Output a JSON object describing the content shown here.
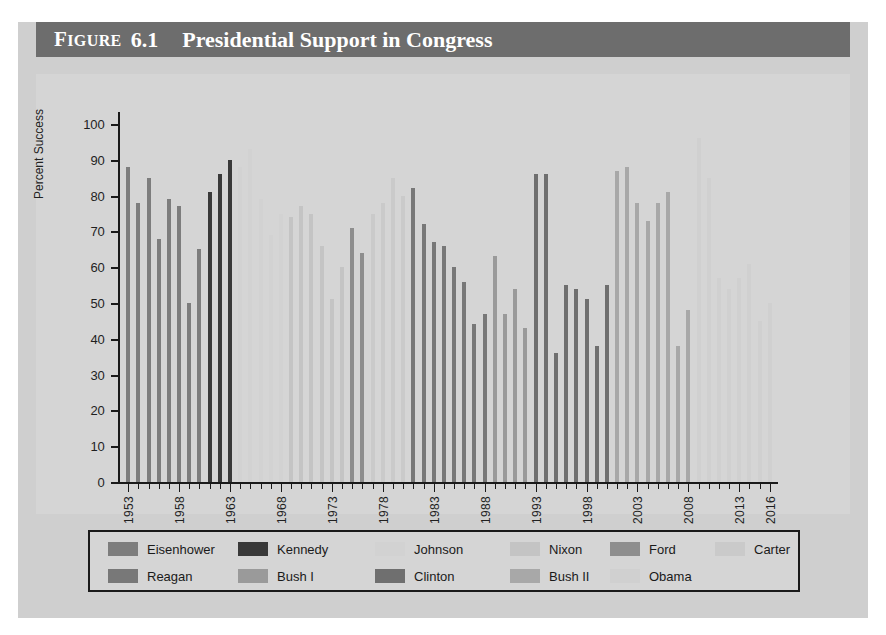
{
  "figure": {
    "label_word": "Figure",
    "number": "6.1",
    "title": "Presidential Support in Congress"
  },
  "colors": {
    "page_background": "#ffffff",
    "figure_background": "#cfcfcf",
    "plot_background": "#d5d5d5",
    "titlebar_background": "#6d6d6d",
    "titlebar_text": "#ffffff",
    "axis": "#1a1a1a"
  },
  "legend": {
    "position": "bottom",
    "rows": [
      [
        {
          "name": "Eisenhower",
          "color": "#7d7d7d"
        },
        {
          "name": "Kennedy",
          "color": "#393939"
        },
        {
          "name": "Johnson",
          "color": "#d2d2d2"
        },
        {
          "name": "Nixon",
          "color": "#c4c4c4"
        },
        {
          "name": "Ford",
          "color": "#8e8e8e"
        },
        {
          "name": "Carter",
          "color": "#cacaca"
        }
      ],
      [
        {
          "name": "Reagan",
          "color": "#787878"
        },
        {
          "name": "Bush I",
          "color": "#9a9a9a"
        },
        {
          "name": "Clinton",
          "color": "#6f6f6f"
        },
        {
          "name": "Bush II",
          "color": "#a8a8a8"
        },
        {
          "name": "Obama",
          "color": "#d0d0d0"
        }
      ]
    ]
  },
  "chart_data": {
    "type": "bar",
    "title": "Presidential Support in Congress",
    "xlabel": "",
    "ylabel": "Percent Success",
    "ylim": [
      0,
      100
    ],
    "ytick_step": 10,
    "yticks": [
      0,
      10,
      20,
      30,
      40,
      50,
      60,
      70,
      80,
      90,
      100
    ],
    "xlim": [
      1953,
      2016
    ],
    "xticks": [
      1953,
      1958,
      1963,
      1968,
      1973,
      1978,
      1983,
      1988,
      1993,
      1998,
      2003,
      2008,
      2013,
      2016
    ],
    "grid": false,
    "legend_position": "bottom",
    "series": [
      {
        "name": "Eisenhower",
        "color": "#7d7d7d",
        "points": [
          {
            "x": 1953,
            "y": 88
          },
          {
            "x": 1954,
            "y": 78
          },
          {
            "x": 1955,
            "y": 85
          },
          {
            "x": 1956,
            "y": 68
          },
          {
            "x": 1957,
            "y": 79
          },
          {
            "x": 1958,
            "y": 77
          },
          {
            "x": 1959,
            "y": 50
          },
          {
            "x": 1960,
            "y": 65
          }
        ]
      },
      {
        "name": "Kennedy",
        "color": "#393939",
        "points": [
          {
            "x": 1961,
            "y": 81
          },
          {
            "x": 1962,
            "y": 86
          },
          {
            "x": 1963,
            "y": 90
          }
        ]
      },
      {
        "name": "Johnson",
        "color": "#d2d2d2",
        "points": [
          {
            "x": 1964,
            "y": 88
          },
          {
            "x": 1965,
            "y": 93
          },
          {
            "x": 1966,
            "y": 79
          },
          {
            "x": 1967,
            "y": 69
          },
          {
            "x": 1968,
            "y": 75
          }
        ]
      },
      {
        "name": "Nixon",
        "color": "#c4c4c4",
        "points": [
          {
            "x": 1969,
            "y": 74
          },
          {
            "x": 1970,
            "y": 77
          },
          {
            "x": 1971,
            "y": 75
          },
          {
            "x": 1972,
            "y": 66
          },
          {
            "x": 1973,
            "y": 51
          },
          {
            "x": 1974,
            "y": 60
          }
        ]
      },
      {
        "name": "Ford",
        "color": "#8e8e8e",
        "points": [
          {
            "x": 1975,
            "y": 71
          },
          {
            "x": 1976,
            "y": 64
          }
        ]
      },
      {
        "name": "Carter",
        "color": "#cacaca",
        "points": [
          {
            "x": 1977,
            "y": 75
          },
          {
            "x": 1978,
            "y": 78
          },
          {
            "x": 1979,
            "y": 85
          },
          {
            "x": 1980,
            "y": 80
          }
        ]
      },
      {
        "name": "Reagan",
        "color": "#787878",
        "points": [
          {
            "x": 1981,
            "y": 82
          },
          {
            "x": 1982,
            "y": 72
          },
          {
            "x": 1983,
            "y": 67
          },
          {
            "x": 1984,
            "y": 66
          },
          {
            "x": 1985,
            "y": 60
          },
          {
            "x": 1986,
            "y": 56
          },
          {
            "x": 1987,
            "y": 44
          },
          {
            "x": 1988,
            "y": 47
          }
        ]
      },
      {
        "name": "Bush I",
        "color": "#9a9a9a",
        "points": [
          {
            "x": 1989,
            "y": 63
          },
          {
            "x": 1990,
            "y": 47
          },
          {
            "x": 1991,
            "y": 54
          },
          {
            "x": 1992,
            "y": 43
          }
        ]
      },
      {
        "name": "Clinton",
        "color": "#6f6f6f",
        "points": [
          {
            "x": 1993,
            "y": 86
          },
          {
            "x": 1994,
            "y": 86
          },
          {
            "x": 1995,
            "y": 36
          },
          {
            "x": 1996,
            "y": 55
          },
          {
            "x": 1997,
            "y": 54
          },
          {
            "x": 1998,
            "y": 51
          },
          {
            "x": 1999,
            "y": 38
          },
          {
            "x": 2000,
            "y": 55
          }
        ]
      },
      {
        "name": "Bush II",
        "color": "#a8a8a8",
        "points": [
          {
            "x": 2001,
            "y": 87
          },
          {
            "x": 2002,
            "y": 88
          },
          {
            "x": 2003,
            "y": 78
          },
          {
            "x": 2004,
            "y": 73
          },
          {
            "x": 2005,
            "y": 78
          },
          {
            "x": 2006,
            "y": 81
          },
          {
            "x": 2007,
            "y": 38
          },
          {
            "x": 2008,
            "y": 48
          }
        ]
      },
      {
        "name": "Obama",
        "color": "#d0d0d0",
        "points": [
          {
            "x": 2009,
            "y": 96
          },
          {
            "x": 2010,
            "y": 85
          },
          {
            "x": 2011,
            "y": 57
          },
          {
            "x": 2012,
            "y": 54
          },
          {
            "x": 2013,
            "y": 57
          },
          {
            "x": 2014,
            "y": 61
          },
          {
            "x": 2015,
            "y": 45
          },
          {
            "x": 2016,
            "y": 50
          }
        ]
      }
    ]
  }
}
